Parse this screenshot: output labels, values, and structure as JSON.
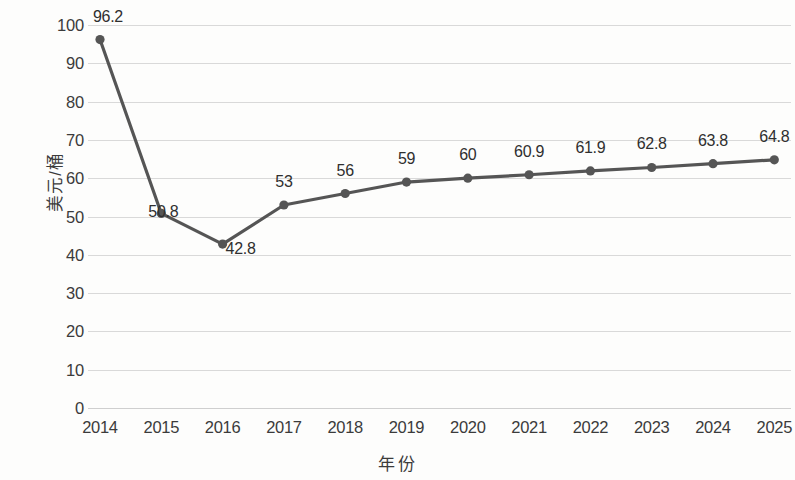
{
  "chart_data": {
    "type": "line",
    "title": "",
    "xlabel": "年份",
    "ylabel": "美元/桶",
    "categories": [
      "2014",
      "2015",
      "2016",
      "2017",
      "2018",
      "2019",
      "2020",
      "2021",
      "2022",
      "2023",
      "2024",
      "2025"
    ],
    "values": [
      96.2,
      50.8,
      42.8,
      53,
      56,
      59,
      60,
      60.9,
      61.9,
      62.8,
      63.8,
      64.8
    ],
    "point_labels": [
      "96.2",
      "50.8",
      "42.8",
      "53",
      "56",
      "59",
      "60",
      "60.9",
      "61.9",
      "62.8",
      "63.8",
      "64.8"
    ],
    "ylim": [
      0,
      100
    ],
    "y_ticks": [
      "0",
      "10",
      "20",
      "30",
      "40",
      "50",
      "60",
      "70",
      "80",
      "90",
      "100"
    ],
    "y_tick_values": [
      0,
      10,
      20,
      30,
      40,
      50,
      60,
      70,
      80,
      90,
      100
    ],
    "grid": true,
    "legend": false,
    "series_color": "#555555",
    "grid_color": "#d9d9d9",
    "text_color": "#3b3b3b",
    "background_color": "#fdfdfc",
    "marker": "circle",
    "data_labels_shown": true
  }
}
